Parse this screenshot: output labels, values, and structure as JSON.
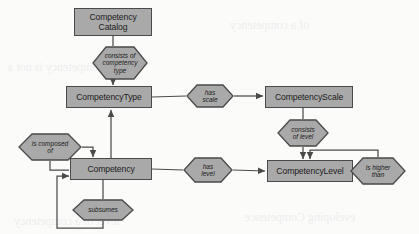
{
  "diagram": {
    "colors": {
      "entity_fill": "#a9a9a9",
      "relationship_fill": "#a9a9a9",
      "stroke": "#4a4a4a",
      "background": "#fbfbfa",
      "text": "#1b1b1b"
    },
    "entities": [
      {
        "id": "competency-catalog",
        "label": "Competency\nCatalog",
        "x": 74,
        "y": 8,
        "w": 78,
        "h": 28
      },
      {
        "id": "competency-type",
        "label": "CompetencyType",
        "x": 66,
        "y": 86,
        "w": 86,
        "h": 22
      },
      {
        "id": "competency-scale",
        "label": "CompetencyScale",
        "x": 265,
        "y": 86,
        "w": 88,
        "h": 22
      },
      {
        "id": "competency",
        "label": "Competency",
        "x": 70,
        "y": 158,
        "w": 82,
        "h": 22
      },
      {
        "id": "competency-level",
        "label": "CompetencyLevel",
        "x": 267,
        "y": 160,
        "w": 86,
        "h": 22
      }
    ],
    "relationships": [
      {
        "id": "consists-of-competency-type",
        "label": "consists of\ncompetency\ntype",
        "x": 92,
        "y": 46,
        "w": 56,
        "h": 34
      },
      {
        "id": "has-scale",
        "label": "has\nscale",
        "x": 186,
        "y": 84,
        "w": 48,
        "h": 24
      },
      {
        "id": "consists-of-level",
        "label": "consists\nof level",
        "x": 277,
        "y": 119,
        "w": 52,
        "h": 28
      },
      {
        "id": "is-composed-of",
        "label": "is composed\nof",
        "x": 18,
        "y": 133,
        "w": 64,
        "h": 28
      },
      {
        "id": "has-level",
        "label": "has\nlevel",
        "x": 183,
        "y": 157,
        "w": 50,
        "h": 26
      },
      {
        "id": "is-higher-than",
        "label": "is higher\nthan",
        "x": 350,
        "y": 157,
        "w": 56,
        "h": 28
      },
      {
        "id": "subsumes",
        "label": "subsumes",
        "x": 72,
        "y": 199,
        "w": 62,
        "h": 22
      }
    ],
    "connections": [
      {
        "from": "competency-catalog",
        "to": "consists-of-competency-type",
        "arrow": false
      },
      {
        "from": "consists-of-competency-type",
        "to": "competency-type",
        "arrow": true
      },
      {
        "from": "competency-type",
        "to": "has-scale",
        "arrow": false
      },
      {
        "from": "has-scale",
        "to": "competency-scale",
        "arrow": true
      },
      {
        "from": "competency-scale",
        "to": "consists-of-level",
        "arrow": false
      },
      {
        "from": "consists-of-level",
        "to": "competency-level",
        "arrow": true
      },
      {
        "from": "competency",
        "to": "competency-type",
        "arrow": true
      },
      {
        "from": "competency",
        "to": "has-level",
        "arrow": false
      },
      {
        "from": "has-level",
        "to": "competency-level",
        "arrow": true
      },
      {
        "from": "is-composed-of",
        "to": "competency",
        "arrow": true
      },
      {
        "from": "competency",
        "to": "is-composed-of",
        "arrow": false
      },
      {
        "from": "subsumes",
        "to": "competency",
        "arrow": true
      },
      {
        "from": "competency",
        "to": "subsumes",
        "arrow": false
      },
      {
        "from": "is-higher-than",
        "to": "competency-level",
        "arrow": true
      },
      {
        "from": "competency-level",
        "to": "is-higher-than",
        "arrow": false
      }
    ]
  }
}
